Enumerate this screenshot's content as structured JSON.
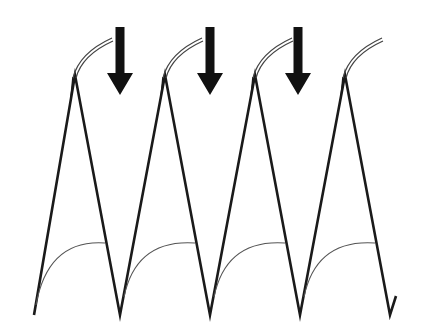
{
  "figure": {
    "colors": {
      "stroke": "#1a1a1a",
      "thin_curve": "#555555",
      "arrow": "#111111",
      "background": "#ffffff"
    },
    "zigzag_points": [
      [
        34,
        315
      ],
      [
        75,
        75
      ],
      [
        120,
        315
      ],
      [
        165,
        75
      ],
      [
        210,
        315
      ],
      [
        255,
        75
      ],
      [
        300,
        315
      ],
      [
        345,
        75
      ],
      [
        390,
        315
      ],
      [
        396,
        296
      ]
    ],
    "peaks": [
      {
        "x": 75,
        "y": 75
      },
      {
        "x": 165,
        "y": 75
      },
      {
        "x": 255,
        "y": 75
      },
      {
        "x": 345,
        "y": 75
      }
    ],
    "arrows": [
      {
        "x": 120,
        "y_top": 27,
        "y_tip": 95
      },
      {
        "x": 210,
        "y_top": 27,
        "y_tip": 95
      },
      {
        "x": 298,
        "y_top": 27,
        "y_tip": 95
      }
    ],
    "arrow_count": 3,
    "cycle_count": 4
  }
}
